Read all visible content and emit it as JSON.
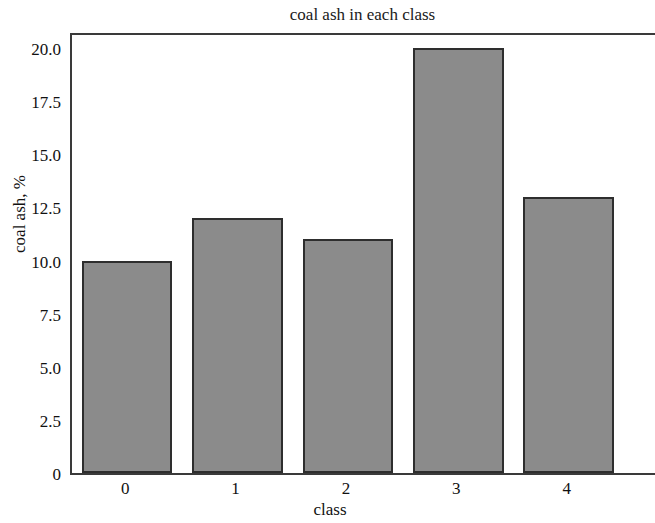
{
  "chart_data": {
    "type": "bar",
    "title": "coal ash in each class",
    "xlabel": "class",
    "ylabel": "coal ash, %",
    "categories": [
      "0",
      "1",
      "2",
      "3",
      "4"
    ],
    "values": [
      10.0,
      12.0,
      11.0,
      20.0,
      13.0
    ],
    "ylim": [
      0,
      20.8
    ],
    "xlim": [
      -0.5,
      4.8
    ],
    "yticks": [
      0,
      2.5,
      5.0,
      7.5,
      10.0,
      12.5,
      15.0,
      17.5,
      20.0
    ],
    "ytick_labels": [
      "0",
      "2.5",
      "5.0",
      "7.5",
      "10.0",
      "12.5",
      "15.0",
      "17.5",
      "20.0"
    ],
    "xtick_labels": [
      "0",
      "1",
      "2",
      "3",
      "4"
    ],
    "grid": false,
    "legend": null,
    "bar_fill_color": "#8b8b8b",
    "bar_edge_color": "#2e2e2e",
    "axis_color": "#3a3a3a",
    "background_color": "#ffffff"
  }
}
